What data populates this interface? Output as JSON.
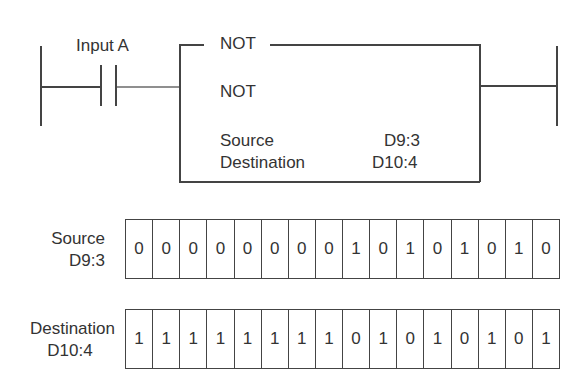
{
  "ladder": {
    "contact_label": "Input A",
    "block": {
      "header": "NOT",
      "instruction": "NOT",
      "rows": [
        {
          "label": "Source",
          "value": "D9:3"
        },
        {
          "label": "Destination",
          "value": "D10:4"
        }
      ]
    }
  },
  "registers": [
    {
      "name": "Source",
      "address": "D9:3",
      "bits": [
        "0",
        "0",
        "0",
        "0",
        "0",
        "0",
        "0",
        "0",
        "1",
        "0",
        "1",
        "0",
        "1",
        "0",
        "1",
        "0"
      ]
    },
    {
      "name": "Destination",
      "address": "D10:4",
      "bits": [
        "1",
        "1",
        "1",
        "1",
        "1",
        "1",
        "1",
        "1",
        "0",
        "1",
        "0",
        "1",
        "0",
        "1",
        "0",
        "1"
      ]
    }
  ]
}
